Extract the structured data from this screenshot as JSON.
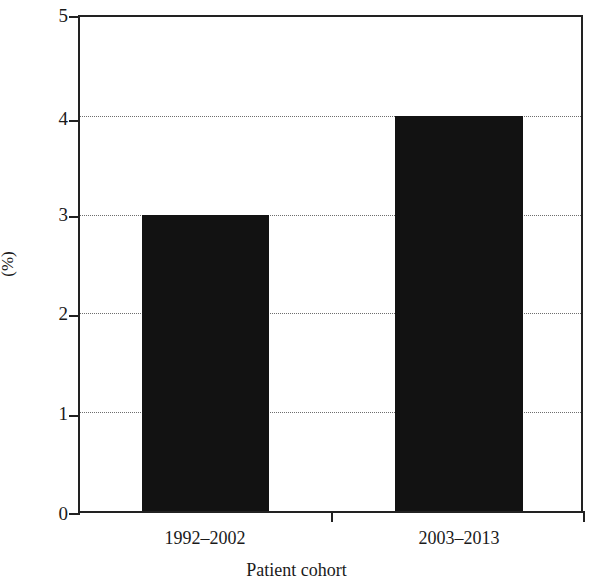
{
  "chart_data": {
    "type": "bar",
    "title": "",
    "subtitle": "",
    "categories": [
      "1992–2002",
      "2003–2013"
    ],
    "values": [
      3,
      4
    ],
    "xlabel": "Patient cohort",
    "ylabel": "(%)",
    "ylim": [
      0,
      5
    ],
    "ytick_labels": [
      "0",
      "1",
      "2",
      "3",
      "4",
      "5"
    ],
    "ytick_values": [
      0,
      1,
      2,
      3,
      4,
      5
    ],
    "grid": true,
    "grid_axis": "y",
    "grid_style": "dotted",
    "legend": false,
    "legend_position": "none",
    "bar_color": "#121212",
    "axis_color": "#222222",
    "grid_color": "#6e6e6e",
    "background_color": "#ffffff",
    "annotations": []
  },
  "axis": {
    "y_title": "(%)",
    "x_title": "Patient cohort"
  }
}
